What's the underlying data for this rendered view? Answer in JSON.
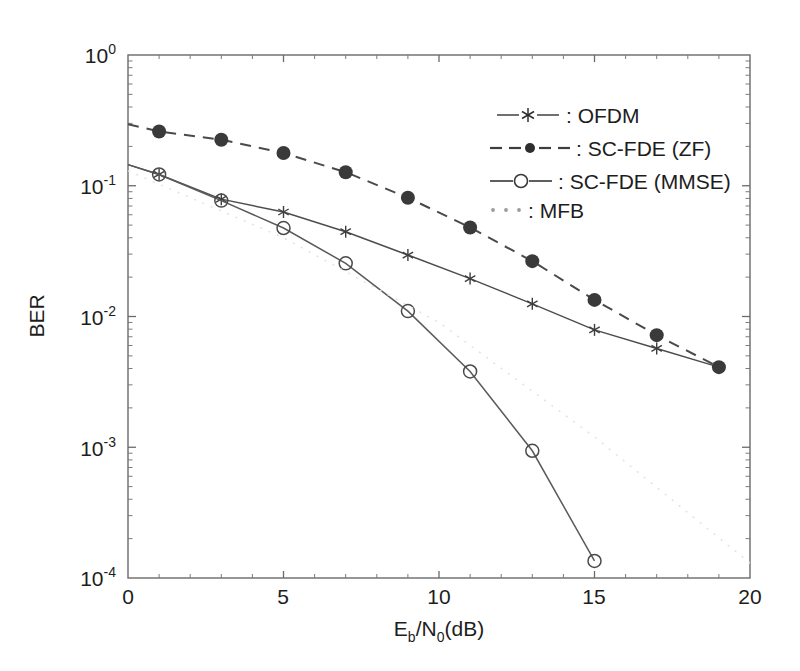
{
  "chart_data": {
    "type": "line",
    "title": "",
    "xlabel": "E_b/N_0(dB)",
    "xlabel_parts": {
      "e": "E",
      "b": "b",
      "slash": "/N",
      "zero": "0",
      "unit": "(dB)"
    },
    "ylabel": "BER",
    "xlim": [
      0,
      20
    ],
    "ylim": [
      0.0001,
      1
    ],
    "yscale": "log",
    "xticks": [
      0,
      5,
      10,
      15,
      20
    ],
    "xtick_labels": [
      "0",
      "5",
      "10",
      "15",
      "20"
    ],
    "yticks": [
      1,
      0.1,
      0.01,
      0.001,
      0.0001
    ],
    "ytick_labels": [
      "10^0",
      "10^-1",
      "10^-2",
      "10^-3",
      "10^-4"
    ],
    "ytick_mantissa": "10",
    "ytick_exponents": [
      "0",
      "-1",
      "-2",
      "-3",
      "-4"
    ],
    "grid": false,
    "legend_position": "upper right",
    "series": [
      {
        "name": "OFDM",
        "legend_label": ": OFDM",
        "marker": "asterisk",
        "linestyle": "solid",
        "color": "#4d4d4d",
        "x": [
          0,
          1,
          3,
          5,
          7,
          9,
          11,
          13,
          15,
          17,
          19
        ],
        "values": [
          0.145,
          0.122,
          0.079,
          0.063,
          0.0445,
          0.0295,
          0.0195,
          0.0125,
          0.0079,
          0.0057,
          0.0041
        ]
      },
      {
        "name": "SC-FDE (ZF)",
        "legend_label": ": SC-FDE (ZF)",
        "marker": "filled-circle",
        "linestyle": "dashed",
        "color": "#4a4a4a",
        "x": [
          0,
          1,
          3,
          5,
          7,
          9,
          11,
          13,
          15,
          17,
          19
        ],
        "values": [
          0.295,
          0.26,
          0.225,
          0.178,
          0.127,
          0.081,
          0.048,
          0.0265,
          0.0134,
          0.0072,
          0.0041
        ]
      },
      {
        "name": "SC-FDE (MMSE)",
        "legend_label": ": SC-FDE (MMSE)",
        "marker": "open-circle",
        "linestyle": "solid",
        "color": "#5a5a5a",
        "x": [
          0,
          1,
          3,
          5,
          7,
          9,
          11,
          13,
          15
        ],
        "values": [
          0.145,
          0.122,
          0.077,
          0.0475,
          0.0255,
          0.011,
          0.0038,
          0.00094,
          0.000135
        ]
      },
      {
        "name": "MFB",
        "legend_label": ": MFB",
        "marker": "none",
        "linestyle": "dotted",
        "color": "#e2e2e2",
        "x": [
          0,
          5,
          10,
          15,
          20
        ],
        "values": [
          0.13,
          0.04,
          0.009,
          0.0012,
          0.00013
        ]
      }
    ]
  },
  "legend": {
    "entries": [
      {
        "label": ": OFDM",
        "style": "solid-asterisk"
      },
      {
        "label": ": SC-FDE (ZF)",
        "style": "dashed-filled-circle"
      },
      {
        "label": ": SC-FDE (MMSE)",
        "style": "solid-open-circle"
      },
      {
        "label": ": MFB",
        "style": "dotted"
      }
    ]
  },
  "axes": {
    "y_label": "BER",
    "x_tick_0": "0",
    "x_tick_5": "5",
    "x_tick_10": "10",
    "x_tick_15": "15",
    "x_tick_20": "20",
    "y_base": "10",
    "y_exp_0": "0",
    "y_exp_1": "-1",
    "y_exp_2": "-2",
    "y_exp_3": "-3",
    "y_exp_4": "-4",
    "x_title_e": "E",
    "x_title_b": "b",
    "x_title_n": "/N",
    "x_title_0": "0",
    "x_title_unit": "(dB)"
  },
  "colors": {
    "axis": "#5a5a5a",
    "ofdm": "#4d4d4d",
    "zf": "#4a4a4a",
    "mmse": "#5a5a5a",
    "mfb": "#e2e2e2",
    "background": "#ffffff"
  }
}
